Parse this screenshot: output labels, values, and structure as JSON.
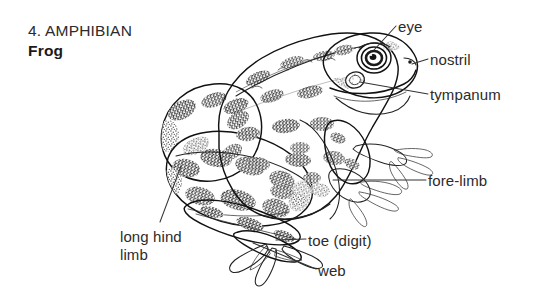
{
  "figure": {
    "number": "4.",
    "category": "AMPHIBIAN",
    "subject": "Frog",
    "title_line1": "4. AMPHIBIAN",
    "title_line2": "Frog",
    "style": "stippled black-and-white line drawing, labelled anatomy diagram",
    "ink_color": "#1a1a1a",
    "background_color": "#ffffff"
  },
  "labels": [
    {
      "id": "eye",
      "text": "eye",
      "x": 398,
      "y": 18,
      "anchor_x": 374,
      "anchor_y": 52,
      "side": "right"
    },
    {
      "id": "nostril",
      "text": "nostril",
      "x": 430,
      "y": 51,
      "anchor_x": 412,
      "anchor_y": 64,
      "side": "right"
    },
    {
      "id": "tympanum",
      "text": "tympanum",
      "x": 430,
      "y": 86,
      "anchor_x": 357,
      "anchor_y": 84,
      "side": "right"
    },
    {
      "id": "fore-limb",
      "text": "fore-limb",
      "x": 428,
      "y": 172,
      "anchor_x": 331,
      "anchor_y": 180,
      "side": "right"
    },
    {
      "id": "toe",
      "text": "toe (digit)",
      "x": 308,
      "y": 232,
      "anchor_x": 276,
      "anchor_y": 240,
      "side": "right"
    },
    {
      "id": "web",
      "text": "web",
      "x": 318,
      "y": 262,
      "anchor_x": 253,
      "anchor_y": 243,
      "side": "right"
    },
    {
      "id": "hind-limb",
      "text": "long hind limb",
      "line1": "long hind",
      "line2": "limb",
      "x": 120,
      "y": 228,
      "anchor_x": 181,
      "anchor_y": 166,
      "side": "left"
    }
  ]
}
